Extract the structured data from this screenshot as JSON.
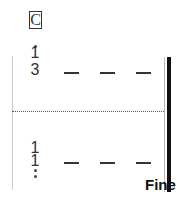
{
  "notation": {
    "rehearsal_mark": "C",
    "upper_staff": {
      "numerals": [
        "1",
        "3"
      ],
      "dashes": 3
    },
    "lower_staff": {
      "numerals": [
        "1",
        "1"
      ],
      "dashes": 3
    },
    "ending_text": "Fine"
  }
}
